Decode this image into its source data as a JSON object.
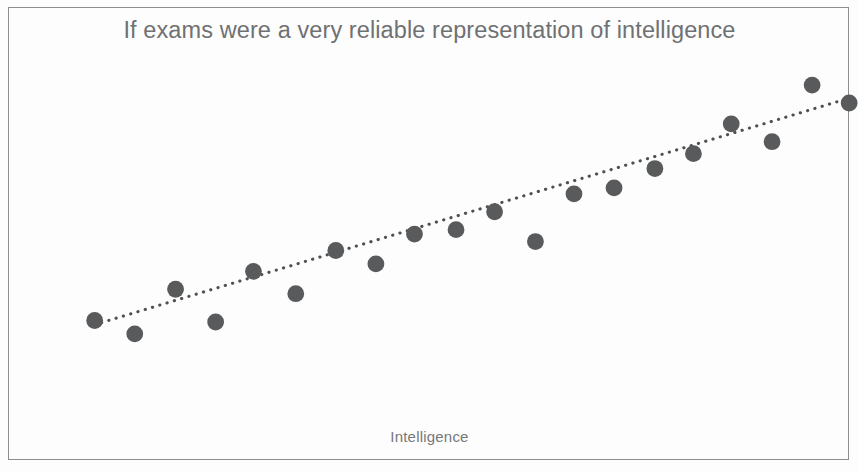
{
  "chart_data": {
    "type": "scatter",
    "title": "If exams were a very reliable representation of intelligence",
    "xlabel": "Intelligence",
    "ylabel": "Exam Scores",
    "grid": false,
    "legend": false,
    "axis_ticks": false,
    "marker_color": "#585a5c",
    "trendline_color": "#4e5052",
    "trendline_style": "dotted",
    "title_color": "#6f7173",
    "axis_label_color": "#76787a",
    "frame_color": "#8b8d8f",
    "background_color": "#fdfdfd",
    "xlim": [
      0,
      100
    ],
    "ylim": [
      0,
      100
    ],
    "points": [
      {
        "x": 3.0,
        "y": 26.0
      },
      {
        "x": 8.3,
        "y": 21.5
      },
      {
        "x": 13.7,
        "y": 36.5
      },
      {
        "x": 19.0,
        "y": 25.5
      },
      {
        "x": 24.0,
        "y": 42.5
      },
      {
        "x": 29.6,
        "y": 35.0
      },
      {
        "x": 34.9,
        "y": 49.5
      },
      {
        "x": 40.2,
        "y": 45.0
      },
      {
        "x": 45.3,
        "y": 55.0
      },
      {
        "x": 50.8,
        "y": 56.5
      },
      {
        "x": 55.9,
        "y": 62.5
      },
      {
        "x": 61.3,
        "y": 52.5
      },
      {
        "x": 66.4,
        "y": 68.5
      },
      {
        "x": 71.7,
        "y": 70.5
      },
      {
        "x": 77.1,
        "y": 77.0
      },
      {
        "x": 82.2,
        "y": 82.0
      },
      {
        "x": 87.2,
        "y": 92.0
      },
      {
        "x": 92.6,
        "y": 86.0
      },
      {
        "x": 97.9,
        "y": 105.0
      },
      {
        "x": 102.8,
        "y": 99.0
      }
    ],
    "trendline": {
      "x_start": 3.9,
      "y_start": 25.3,
      "x_end": 101.6,
      "y_end": 99.7
    }
  }
}
